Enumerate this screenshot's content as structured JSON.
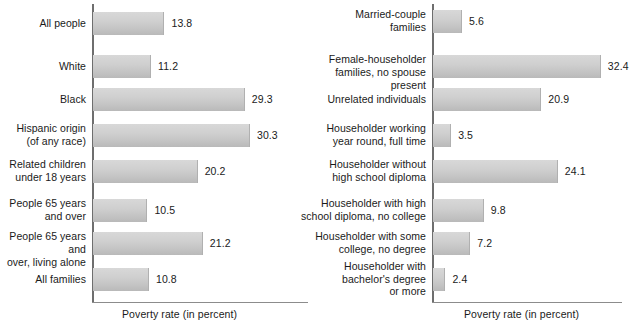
{
  "chart_data": [
    {
      "type": "bar",
      "orientation": "horizontal",
      "panel": "left",
      "title": "",
      "xlabel": "Poverty rate (in percent)",
      "ylabel": "",
      "xlim": [
        0,
        34
      ],
      "grid": false,
      "legend": "none",
      "categories": [
        "All people",
        "White",
        "Black",
        "Hispanic origin (of any race)",
        "Related children under 18 years",
        "People 65 years and over",
        "People 65 years and over, living alone",
        "All families"
      ],
      "category_lines": [
        [
          "All people"
        ],
        [
          "White"
        ],
        [
          "Black"
        ],
        [
          "Hispanic origin",
          "(of any race)"
        ],
        [
          "Related children",
          "under 18 years"
        ],
        [
          "People 65 years",
          "and over"
        ],
        [
          "People 65 years and",
          "over, living alone"
        ],
        [
          "All families"
        ]
      ],
      "values": [
        13.8,
        11.2,
        29.3,
        30.3,
        20.2,
        10.5,
        21.2,
        10.8
      ],
      "value_labels": [
        "13.8",
        "11.2",
        "29.3",
        "30.3",
        "20.2",
        "10.5",
        "21.2",
        "10.8"
      ]
    },
    {
      "type": "bar",
      "orientation": "horizontal",
      "panel": "right",
      "title": "",
      "xlabel": "Poverty rate (in percent)",
      "ylabel": "",
      "xlim": [
        0,
        34
      ],
      "grid": false,
      "legend": "none",
      "categories": [
        "Married-couple families",
        "Female-householder families, no spouse present",
        "Unrelated individuals",
        "Householder working year round, full time",
        "Householder without high school diploma",
        "Householder with high school diploma, no college",
        "Householder with some college, no degree",
        "Householder with bachelor's degree or more"
      ],
      "category_lines": [
        [
          "Married-couple",
          "families"
        ],
        [
          "Female-householder",
          "families, no spouse present"
        ],
        [
          "Unrelated individuals"
        ],
        [
          "Householder working",
          "year round, full time"
        ],
        [
          "Householder without",
          "high school diploma"
        ],
        [
          "Householder with high",
          "school diploma, no college"
        ],
        [
          "Householder with some",
          "college, no degree"
        ],
        [
          "Householder with",
          "bachelor's degree",
          "or more"
        ]
      ],
      "values": [
        5.6,
        32.4,
        20.9,
        3.5,
        24.1,
        9.8,
        7.2,
        2.4
      ],
      "value_labels": [
        "5.6",
        "32.4",
        "20.9",
        "3.5",
        "24.1",
        "9.8",
        "7.2",
        "2.4"
      ]
    }
  ],
  "style": {
    "bar_fill_light": "#d8d8d8",
    "bar_fill_dark": "#b9b9b9",
    "axis_color": "#6e6e6e",
    "text_color": "#1a1a1a",
    "background": "#ffffff"
  }
}
